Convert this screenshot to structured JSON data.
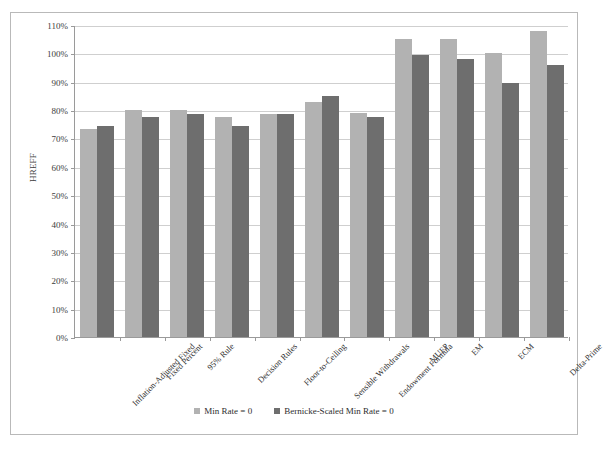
{
  "chart_data": {
    "type": "bar",
    "title": "",
    "xlabel": "",
    "ylabel": "HREFF",
    "ylim": [
      0,
      110
    ],
    "y_tick_labels": [
      "110%",
      "100%",
      "90%",
      "80%",
      "70%",
      "60%",
      "50%",
      "40%",
      "30%",
      "20%",
      "10%",
      "0%"
    ],
    "y_tick_values": [
      110,
      100,
      90,
      80,
      70,
      60,
      50,
      40,
      30,
      20,
      10,
      0
    ],
    "grid": true,
    "legend_position": "bottom",
    "categories": [
      "Inflation-Adjusted Fixed",
      "Fixed Percent",
      "95% Rule",
      "Decision Rules",
      "Floor-to-Ceiling",
      "Sensible Withdrawals",
      "Endowment Formula",
      "MUFP",
      "EM",
      "ECM",
      "Delta-Prime"
    ],
    "series": [
      {
        "name": "Min Rate = 0",
        "color": "#b2b2b2",
        "values": [
          73.5,
          80.0,
          80.0,
          77.5,
          78.5,
          83.0,
          79.0,
          105.0,
          105.0,
          100.0,
          108.0
        ]
      },
      {
        "name": "Bernicke-Scaled Min Rate = 0",
        "color": "#6e6e6e",
        "values": [
          74.5,
          77.5,
          78.5,
          74.5,
          78.5,
          85.0,
          77.5,
          99.5,
          98.0,
          89.5,
          96.0
        ]
      }
    ]
  },
  "legend": {
    "items": [
      {
        "label": "Min Rate = 0",
        "swatch": "light-gray-swatch"
      },
      {
        "label": "Bernicke-Scaled Min Rate = 0",
        "swatch": "dark-gray-swatch"
      }
    ]
  }
}
